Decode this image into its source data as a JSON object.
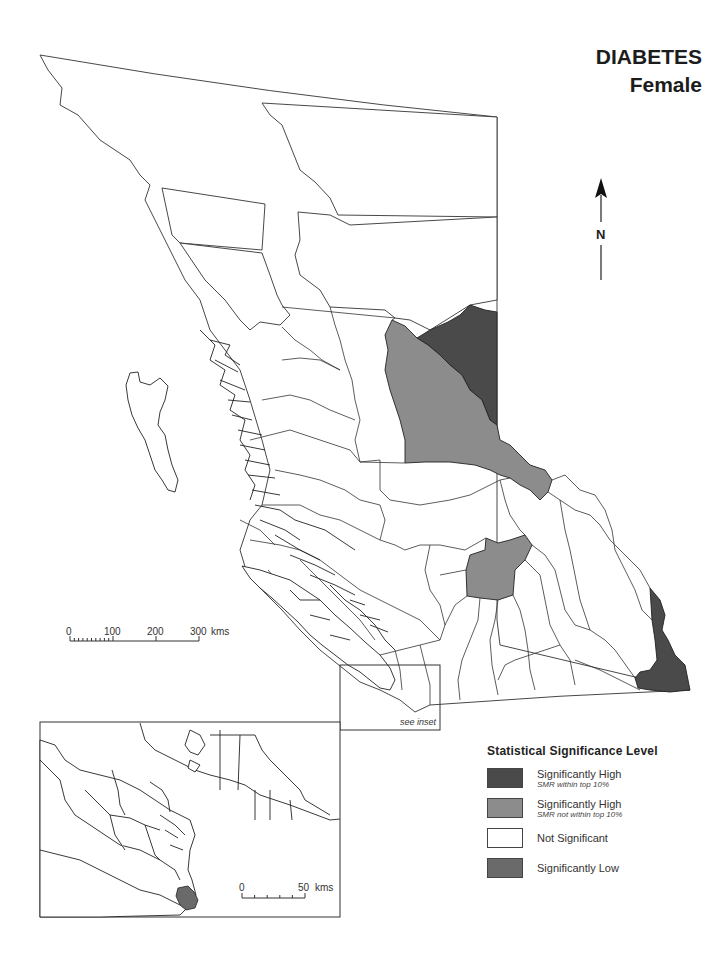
{
  "title": {
    "disease": "DIABETES",
    "sex": "Female"
  },
  "north_arrow": {
    "label": "N"
  },
  "main_scale": {
    "ticks": [
      "0",
      "100",
      "200",
      "300"
    ],
    "unit": "kms"
  },
  "inset_scale": {
    "ticks": [
      "0",
      "50"
    ],
    "unit": "kms"
  },
  "inset_note": "see inset",
  "legend": {
    "title": "Statistical Significance Level",
    "items": [
      {
        "label": "Significantly High",
        "sub": "SMR within top 10%",
        "color": "#4a4a4a"
      },
      {
        "label": "Significantly High",
        "sub": "SMR not within top 10%",
        "color": "#8c8c8c"
      },
      {
        "label": "Not Significant",
        "sub": "",
        "color": "#ffffff"
      },
      {
        "label": "Significantly Low",
        "sub": "",
        "color": "#6a6a6a"
      }
    ]
  },
  "colors": {
    "sig_high_top10": "#4a4a4a",
    "sig_high_not_top10": "#8c8c8c",
    "not_significant": "#ffffff",
    "sig_low": "#6a6a6a",
    "boundary": "#333333"
  }
}
